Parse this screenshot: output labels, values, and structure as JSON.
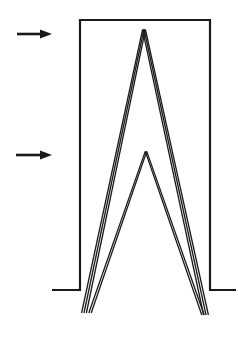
{
  "diagram": {
    "stroke_color": "#1a1a1a",
    "background": "#ffffff",
    "enclosure": {
      "shape": "rectangle-with-flanges",
      "left_x": 80,
      "right_x": 210,
      "top_y": 20,
      "base_y": 290,
      "left_flange_x": 52,
      "right_flange_x": 236
    },
    "arrows": [
      {
        "name": "upper-arrow",
        "y": 34,
        "x_start": 17,
        "x_end": 52
      },
      {
        "name": "lower-arrow",
        "y": 155,
        "x_start": 16,
        "x_end": 52
      }
    ],
    "peaks": [
      {
        "name": "tall-peak",
        "apex": [
          144,
          29
        ],
        "left_base": [
          84,
          313
        ],
        "right_base": [
          206,
          315
        ],
        "lines": 3
      },
      {
        "name": "short-peak",
        "apex": [
          146,
          151
        ],
        "left_base": [
          90,
          313
        ],
        "right_base": [
          203,
          315
        ],
        "lines": 2
      }
    ]
  }
}
